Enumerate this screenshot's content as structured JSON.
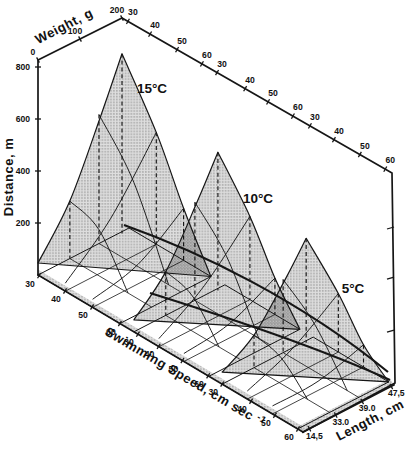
{
  "figure": {
    "background": "#ffffff",
    "ink_color": "#161616",
    "temperature_labels": [
      "15°C",
      "10°C",
      "5°C"
    ],
    "axis_titles": {
      "distance": "Distance, m",
      "weight": "Weight, g",
      "speed_main": "Swimming Speed, cm sec ",
      "speed_superscript": "-1",
      "length": "Length, cm"
    },
    "tick_labels": {
      "distance": [
        "200",
        "400",
        "600",
        "800"
      ],
      "weight": [
        "0",
        "100",
        "200"
      ],
      "speed_top": [
        "30",
        "40",
        "50",
        "60",
        "30",
        "40",
        "50",
        "60",
        "30",
        "40",
        "50",
        "60"
      ],
      "speed_bottom": [
        "30",
        "40",
        "50",
        "60",
        "30",
        "40",
        "50",
        "60",
        "30",
        "40",
        "50",
        "60"
      ],
      "length": [
        "14,5",
        "33.0",
        "39.0",
        "47,5"
      ]
    }
  },
  "chart_data": {
    "type": "line",
    "presentation": "3d-surface-panels",
    "title": "",
    "xlabel": "Swimming Speed, cm sec -1",
    "ylabel": "Distance, m",
    "zlabels": [
      "Weight, g",
      "Length, cm"
    ],
    "x_range_per_panel": [
      30,
      60
    ],
    "y_range": [
      0,
      800
    ],
    "y_ticks": [
      200,
      400,
      600,
      800
    ],
    "weight_ticks_g": [
      0,
      100,
      200
    ],
    "length_ticks_cm": [
      14.5,
      33.0,
      39.0,
      47.5
    ],
    "grid": true,
    "legend": "none",
    "panels": [
      {
        "name": "15°C",
        "temperature_c": 15,
        "peak_distance_m": 670,
        "envelope": {
          "speed": [
            30,
            40,
            50,
            60
          ],
          "distance_m": [
            670,
            430,
            200,
            0
          ]
        }
      },
      {
        "name": "10°C",
        "temperature_c": 10,
        "peak_distance_m": 510,
        "envelope": {
          "speed": [
            30,
            40,
            50,
            60
          ],
          "distance_m": [
            510,
            320,
            140,
            0
          ]
        }
      },
      {
        "name": "5°C",
        "temperature_c": 5,
        "peak_distance_m": 380,
        "envelope": {
          "speed": [
            30,
            40,
            50,
            60
          ],
          "distance_m": [
            380,
            225,
            85,
            0
          ]
        }
      }
    ]
  }
}
